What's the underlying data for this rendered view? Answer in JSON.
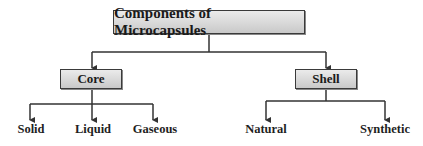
{
  "diagram": {
    "root": {
      "label": "Components of Microcapsules"
    },
    "branches": [
      {
        "label": "Core",
        "children": [
          "Solid",
          "Liquid",
          "Gaseous"
        ]
      },
      {
        "label": "Shell",
        "children": [
          "Natural",
          "Synthetic"
        ]
      }
    ],
    "colors": {
      "box_fill_top": "#ebebeb",
      "box_fill_bottom": "#c9c9c9",
      "border": "#3a3a3a",
      "line": "#333333",
      "text": "#1a1a1a"
    }
  }
}
